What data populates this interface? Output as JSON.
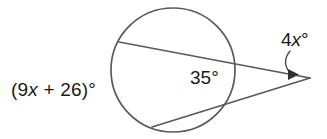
{
  "figure": {
    "background_color": "#ffffff",
    "stroke_color": "#595959",
    "text_color": "#1a1a1a"
  },
  "labels": {
    "far_arc": {
      "full": "(9x + 26)°",
      "prefix": "(9",
      "variable": "x",
      "suffix": " + 26)°"
    },
    "near_arc": {
      "full": "35°",
      "value": "35",
      "degree": "°"
    },
    "vertex_angle": {
      "full": "4x°",
      "coefficient": "4",
      "variable": "x",
      "degree": "°"
    }
  },
  "geometry": {
    "circle": {
      "cx": 173,
      "cy": 70,
      "r": 62
    },
    "vertex": {
      "x": 310,
      "y": 78
    },
    "secant_upper": {
      "x1": 119,
      "y1": 42,
      "x2": 310,
      "y2": 78
    },
    "secant_lower": {
      "x1": 152,
      "y1": 127,
      "x2": 310,
      "y2": 78
    },
    "leader": {
      "from_x": 288,
      "from_y": 52,
      "to_x": 296,
      "to_y": 75
    }
  }
}
